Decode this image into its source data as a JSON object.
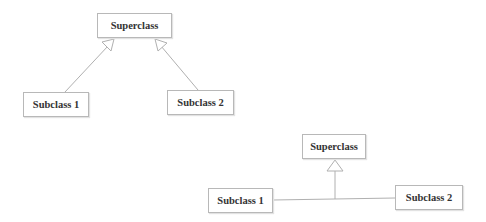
{
  "diagram_a": {
    "superclass": {
      "label": "Superclass"
    },
    "subclass_1": {
      "label": "Subclass 1"
    },
    "subclass_2": {
      "label": "Subclass 2"
    },
    "style": "separate hollow-triangle arrows (generalization)"
  },
  "diagram_b": {
    "superclass": {
      "label": "Superclass"
    },
    "subclass_1": {
      "label": "Subclass 1"
    },
    "subclass_2": {
      "label": "Subclass 2"
    },
    "style": "shared target (tree) generalization"
  },
  "colors": {
    "line": "#b0b0b0",
    "border": "#b8b8b8",
    "text": "#333333"
  }
}
